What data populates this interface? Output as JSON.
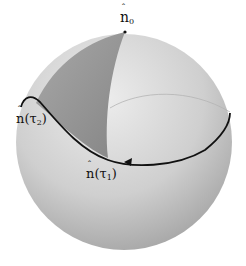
{
  "diagram": {
    "type": "sphere-path",
    "labels": {
      "n0": {
        "base": "n",
        "sub": "0"
      },
      "n_tau1": {
        "base": "n",
        "arg": "(τ",
        "sub": "1",
        "close": ")"
      },
      "n_tau2": {
        "base": "n",
        "arg": "(τ",
        "sub": "2",
        "close": ")"
      }
    },
    "colors": {
      "sphere_light": "#e2e2e2",
      "sphere_dark": "#9a9a9a",
      "shaded_region": "#8c8c8c",
      "curve": "#111111",
      "back_curve": "#b0b0b0"
    }
  }
}
